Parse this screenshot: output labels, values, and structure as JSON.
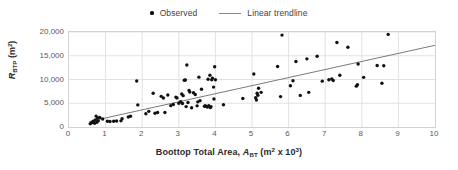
{
  "chart_data": {
    "type": "scatter",
    "title": "",
    "xlabel": "Boottop Total Area, A_BT (m² x 10³)",
    "ylabel": "R_BTP (m²)",
    "xlim": [
      0,
      10
    ],
    "ylim": [
      0,
      20000
    ],
    "xticks": [
      "0",
      "1",
      "2",
      "3",
      "4",
      "5",
      "6",
      "7",
      "8",
      "9",
      "10"
    ],
    "yticks": [
      "0",
      "5,000",
      "10,000",
      "15,000",
      "20,000"
    ],
    "grid": true,
    "legend_position": "top-center",
    "series": [
      {
        "name": "Observed",
        "type": "scatter",
        "marker": "dot",
        "color": "#111111",
        "points": [
          [
            0.58,
            700
          ],
          [
            0.62,
            900
          ],
          [
            0.66,
            1200
          ],
          [
            0.7,
            800
          ],
          [
            0.72,
            1500
          ],
          [
            0.74,
            2300
          ],
          [
            0.76,
            1000
          ],
          [
            0.78,
            1900
          ],
          [
            0.8,
            1300
          ],
          [
            0.84,
            2000
          ],
          [
            0.92,
            1700
          ],
          [
            1.05,
            1200
          ],
          [
            1.12,
            1150
          ],
          [
            1.22,
            1200
          ],
          [
            1.3,
            1250
          ],
          [
            1.42,
            1300
          ],
          [
            1.45,
            1750
          ],
          [
            1.62,
            2100
          ],
          [
            1.68,
            2250
          ],
          [
            1.85,
            9700
          ],
          [
            1.88,
            4650
          ],
          [
            2.1,
            2800
          ],
          [
            2.18,
            3300
          ],
          [
            2.3,
            7100
          ],
          [
            2.35,
            2900
          ],
          [
            2.42,
            3050
          ],
          [
            2.52,
            6450
          ],
          [
            2.58,
            6100
          ],
          [
            2.62,
            3050
          ],
          [
            2.7,
            6750
          ],
          [
            2.78,
            4500
          ],
          [
            2.85,
            4750
          ],
          [
            2.92,
            6300
          ],
          [
            2.95,
            6100
          ],
          [
            3.0,
            5000
          ],
          [
            3.05,
            5350
          ],
          [
            3.08,
            6950
          ],
          [
            3.1,
            4950
          ],
          [
            3.12,
            6600
          ],
          [
            3.15,
            9850
          ],
          [
            3.18,
            9900
          ],
          [
            3.2,
            4300
          ],
          [
            3.22,
            13050
          ],
          [
            3.25,
            5150
          ],
          [
            3.28,
            7700
          ],
          [
            3.3,
            7350
          ],
          [
            3.35,
            4050
          ],
          [
            3.4,
            7200
          ],
          [
            3.45,
            6850
          ],
          [
            3.5,
            4450
          ],
          [
            3.52,
            5300
          ],
          [
            3.55,
            10500
          ],
          [
            3.58,
            5550
          ],
          [
            3.62,
            7950
          ],
          [
            3.7,
            4350
          ],
          [
            3.72,
            4500
          ],
          [
            3.75,
            4350
          ],
          [
            3.78,
            4200
          ],
          [
            3.8,
            10050
          ],
          [
            3.82,
            4500
          ],
          [
            3.85,
            10900
          ],
          [
            3.86,
            4100
          ],
          [
            3.88,
            4250
          ],
          [
            3.9,
            9950
          ],
          [
            3.92,
            10300
          ],
          [
            3.95,
            8400
          ],
          [
            3.96,
            5900
          ],
          [
            3.98,
            12700
          ],
          [
            4.0,
            9950
          ],
          [
            4.22,
            4700
          ],
          [
            4.75,
            6000
          ],
          [
            5.05,
            11150
          ],
          [
            5.1,
            6150
          ],
          [
            5.12,
            5700
          ],
          [
            5.14,
            7100
          ],
          [
            5.16,
            6700
          ],
          [
            5.18,
            8150
          ],
          [
            5.25,
            7300
          ],
          [
            5.7,
            12750
          ],
          [
            5.78,
            6400
          ],
          [
            5.82,
            19350
          ],
          [
            6.05,
            8700
          ],
          [
            6.12,
            9750
          ],
          [
            6.2,
            13800
          ],
          [
            6.32,
            6650
          ],
          [
            6.5,
            14350
          ],
          [
            6.55,
            7300
          ],
          [
            6.78,
            14900
          ],
          [
            6.92,
            9650
          ],
          [
            7.1,
            9950
          ],
          [
            7.18,
            10100
          ],
          [
            7.22,
            9800
          ],
          [
            7.32,
            17800
          ],
          [
            7.4,
            10900
          ],
          [
            7.62,
            16800
          ],
          [
            7.85,
            8600
          ],
          [
            7.88,
            8900
          ],
          [
            7.9,
            13250
          ],
          [
            8.05,
            10450
          ],
          [
            8.42,
            12950
          ],
          [
            8.55,
            9200
          ],
          [
            8.6,
            12900
          ],
          [
            8.72,
            19500
          ]
        ]
      },
      {
        "name": "Linear trendline",
        "type": "line",
        "color": "#7a7a7a",
        "x_start": 0.55,
        "y_start": 1150,
        "x_end": 10.0,
        "y_end": 17200
      }
    ]
  },
  "legend": {
    "entries": [
      {
        "label": "Observed",
        "marker": "dot-marker"
      },
      {
        "label": "Linear trendline",
        "marker": "line-marker"
      }
    ]
  },
  "axes": {
    "y_title_main": "R",
    "y_title_sub": "BTP",
    "y_title_unit_open": " (m",
    "y_title_unit_sup": "2",
    "y_title_unit_close": ")",
    "x_title_main": "Boottop Total Area, ",
    "x_title_var": "A",
    "x_title_var_sub": "BT",
    "x_title_unit_open": " (m",
    "x_title_unit_sup": "2",
    "x_title_unit_mid": " x 10",
    "x_title_unit_sup2": "3",
    "x_title_unit_close": ")"
  },
  "colors": {
    "marker": "#111111",
    "trendline": "#7a7a7a",
    "grid": "#e2e2e2",
    "frame": "#d2d2d2",
    "tick_text": "#5a5a5a",
    "axis_title": "#2b2b2b"
  }
}
